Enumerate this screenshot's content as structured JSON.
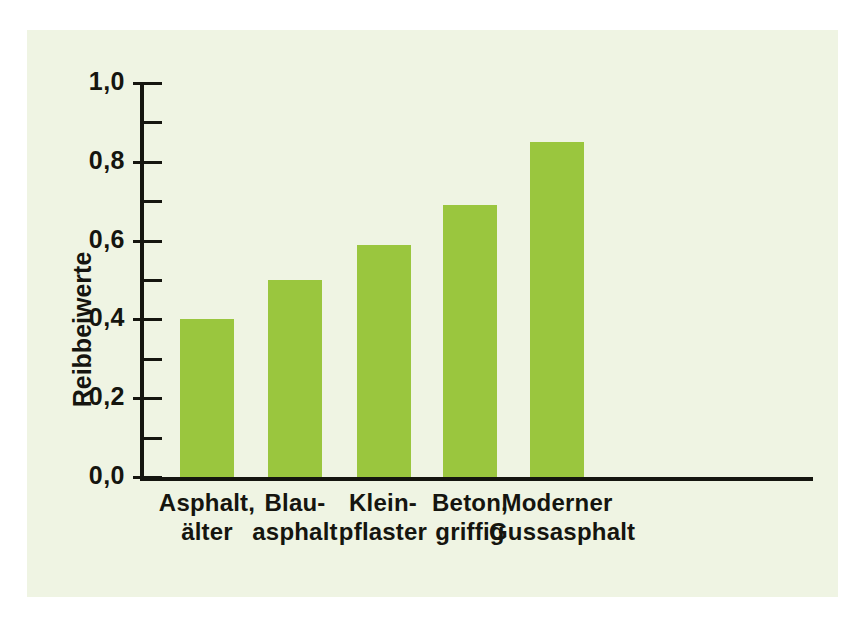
{
  "figure": {
    "panel_background": "#eff4e3",
    "page_background": "#ffffff",
    "axis_color": "#15150f",
    "bar_color": "#9ac63e"
  },
  "chart_data": {
    "type": "bar",
    "title": "",
    "xlabel": "",
    "ylabel": "Reibbeiwerte",
    "categories": [
      "Asphalt,\nälter",
      "Blau-\nasphalt",
      "Klein-\npflaster",
      "Beton,\ngriffig",
      "Moderner\nGussasphalt"
    ],
    "category_lines": [
      [
        "Asphalt,",
        "älter"
      ],
      [
        "Blau-",
        "asphalt"
      ],
      [
        "Klein-",
        "pflaster"
      ],
      [
        "Beton,",
        "griffig"
      ],
      [
        "Moderner",
        "Gussasphalt"
      ]
    ],
    "values": [
      0.4,
      0.5,
      0.59,
      0.69,
      0.85
    ],
    "ylim": [
      0.0,
      1.0
    ],
    "ytick_values": [
      0.0,
      0.2,
      0.4,
      0.6,
      0.8,
      1.0
    ],
    "ytick_labels": [
      "0,0",
      "0,2",
      "0,4",
      "0,6",
      "0,8",
      "1,0"
    ],
    "yminor_values": [
      0.1,
      0.3,
      0.5,
      0.7,
      0.9
    ],
    "grid": false,
    "legend": null,
    "legend_position": "none"
  }
}
